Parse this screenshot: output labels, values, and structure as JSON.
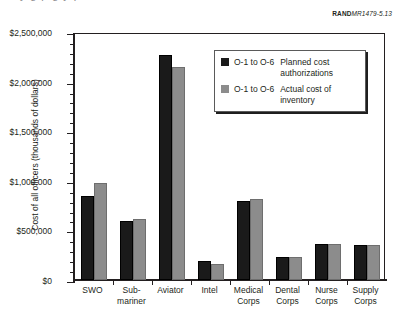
{
  "figure_id": {
    "prefix": "RAND",
    "number": "MR1479-5.13"
  },
  "page_bleed_text": "y g p g y p",
  "legend": {
    "entries": [
      {
        "rank_range": "O-1 to O-6",
        "description": "Planned cost authorizations",
        "swatch": "black-square-icon",
        "color": "#1a1a1a"
      },
      {
        "rank_range": "O-1 to O-6",
        "description": "Actual cost of inventory",
        "swatch": "gray-square-icon",
        "color": "#8c8c8c"
      }
    ]
  },
  "chart_data": {
    "type": "bar",
    "title": "",
    "xlabel": "",
    "ylabel": "Cost of all officers (thousands of dollars)",
    "ylim": [
      0,
      2500000
    ],
    "ytick_values": [
      0,
      500000,
      1000000,
      1500000,
      2000000,
      2500000
    ],
    "ytick_labels": [
      "$0",
      "$500,000",
      "$1,000,000",
      "$1,500,000",
      "$2,000,000",
      "$2,500,000"
    ],
    "yminor_interval": 100000,
    "grid": false,
    "legend_position": "upper-right-inside",
    "categories": [
      "SWO",
      "Sub-\nmariner",
      "Aviator",
      "Intel",
      "Medical\nCorps",
      "Dental\nCorps",
      "Nurse\nCorps",
      "Supply\nCorps"
    ],
    "series": [
      {
        "name": "O-1 to O-6 Planned cost authorizations",
        "color": "#1a1a1a",
        "values": [
          847000,
          595000,
          2270000,
          190000,
          797000,
          232000,
          363000,
          355000
        ]
      },
      {
        "name": "O-1 to O-6 Actual cost of inventory",
        "color": "#8c8c8c",
        "values": [
          978000,
          620000,
          2150000,
          162000,
          812000,
          232000,
          363000,
          355000
        ]
      }
    ]
  }
}
